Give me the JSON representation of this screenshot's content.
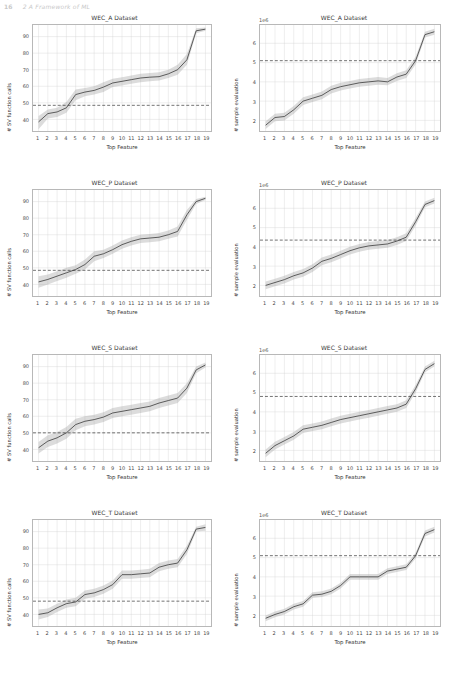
{
  "header": {
    "page_number": "16",
    "running_title": "2 A Framework of ML"
  },
  "figure": {
    "xlabel": "Top Feature",
    "ylabel_left": "# SV function calls",
    "ylabel_right": "# sample evaluation",
    "offset_label_right": "1e6",
    "xticks": [
      "1",
      "2",
      "3",
      "4",
      "5",
      "6",
      "7",
      "8",
      "9",
      "10",
      "11",
      "12",
      "13",
      "14",
      "15",
      "16",
      "17",
      "18",
      "19"
    ],
    "yticks_left": [
      "40",
      "50",
      "60",
      "70",
      "80",
      "90"
    ],
    "yticks_right": [
      "2",
      "3",
      "4",
      "5",
      "6"
    ]
  },
  "chart_data": [
    {
      "type": "line",
      "title": "WEC_A Dataset",
      "xlabel": "Top Feature",
      "ylabel": "# SV function calls",
      "x": [
        1,
        2,
        3,
        4,
        5,
        6,
        7,
        8,
        9,
        10,
        11,
        12,
        13,
        14,
        15,
        16,
        17,
        18,
        19
      ],
      "values": [
        38.5,
        43.5,
        44.5,
        47.0,
        55.0,
        56.5,
        57.5,
        59.5,
        62.0,
        63.0,
        64.0,
        65.0,
        65.5,
        65.8,
        67.5,
        70.0,
        76.0,
        93.5,
        94.5
      ],
      "band_lower": [
        34.0,
        40.5,
        41.5,
        44.0,
        51.5,
        54.0,
        55.0,
        56.5,
        59.5,
        60.5,
        61.5,
        62.5,
        63.0,
        63.5,
        65.0,
        67.0,
        73.0,
        92.0,
        93.5
      ],
      "band_upper": [
        42.0,
        46.0,
        47.0,
        50.5,
        58.0,
        59.0,
        60.0,
        62.5,
        64.5,
        65.5,
        66.5,
        67.5,
        68.0,
        68.5,
        70.0,
        73.0,
        79.5,
        95.0,
        95.5
      ],
      "hline": 48.5,
      "ylim": [
        33,
        97
      ],
      "xlim": [
        0.4,
        19.6
      ],
      "grid": true,
      "legend": "none"
    },
    {
      "type": "line",
      "title": "WEC_A Dataset",
      "xlabel": "Top Feature",
      "ylabel": "# sample evaluation",
      "offset": "1e6",
      "x": [
        1,
        2,
        3,
        4,
        5,
        6,
        7,
        8,
        9,
        10,
        11,
        12,
        13,
        14,
        15,
        16,
        17,
        18,
        19
      ],
      "values": [
        1.75,
        2.15,
        2.2,
        2.55,
        3.0,
        3.15,
        3.3,
        3.6,
        3.75,
        3.85,
        3.95,
        4.0,
        4.05,
        4.0,
        4.25,
        4.4,
        5.1,
        6.45,
        6.6
      ],
      "band_lower": [
        1.55,
        1.95,
        2.0,
        2.35,
        2.8,
        2.95,
        3.1,
        3.4,
        3.55,
        3.65,
        3.75,
        3.8,
        3.85,
        3.82,
        4.05,
        4.2,
        4.9,
        6.3,
        6.45
      ],
      "band_upper": [
        1.95,
        2.35,
        2.4,
        2.75,
        3.2,
        3.35,
        3.5,
        3.8,
        3.95,
        4.05,
        4.15,
        4.2,
        4.25,
        4.2,
        4.45,
        4.6,
        5.3,
        6.6,
        6.75
      ],
      "hline": 5.1,
      "ylim": [
        1.45,
        6.95
      ],
      "xlim": [
        0.4,
        19.6
      ],
      "grid": true,
      "legend": "none"
    },
    {
      "type": "line",
      "title": "WEC_P Dataset",
      "xlabel": "Top Feature",
      "ylabel": "# SV function calls",
      "x": [
        1,
        2,
        3,
        4,
        5,
        6,
        7,
        8,
        9,
        10,
        11,
        12,
        13,
        14,
        15,
        16,
        17,
        18,
        19
      ],
      "values": [
        41.5,
        43.0,
        45.0,
        47.0,
        49.0,
        52.0,
        57.0,
        58.5,
        61.0,
        64.0,
        66.0,
        67.5,
        68.0,
        68.5,
        70.0,
        72.0,
        82.0,
        90.0,
        92.0
      ],
      "band_lower": [
        38.0,
        40.0,
        42.0,
        44.0,
        46.5,
        49.0,
        54.0,
        56.0,
        58.5,
        61.5,
        63.5,
        65.0,
        65.5,
        66.0,
        67.5,
        69.0,
        79.0,
        88.5,
        91.0
      ],
      "band_upper": [
        45.0,
        46.0,
        48.0,
        50.0,
        51.5,
        55.0,
        60.0,
        61.0,
        63.5,
        66.5,
        68.5,
        70.0,
        70.5,
        71.0,
        72.5,
        75.0,
        85.0,
        91.5,
        93.0
      ],
      "hline": 48.5,
      "ylim": [
        33,
        97
      ],
      "xlim": [
        0.4,
        19.6
      ],
      "grid": true,
      "legend": "none"
    },
    {
      "type": "line",
      "title": "WEC_P Dataset",
      "xlabel": "Top Feature",
      "ylabel": "# sample evaluation",
      "offset": "1e6",
      "x": [
        1,
        2,
        3,
        4,
        5,
        6,
        7,
        8,
        9,
        10,
        11,
        12,
        13,
        14,
        15,
        16,
        17,
        18,
        19
      ],
      "values": [
        2.0,
        2.15,
        2.3,
        2.5,
        2.65,
        2.9,
        3.25,
        3.4,
        3.6,
        3.8,
        3.95,
        4.05,
        4.1,
        4.15,
        4.3,
        4.5,
        5.3,
        6.2,
        6.4
      ],
      "band_lower": [
        1.8,
        1.95,
        2.1,
        2.3,
        2.45,
        2.7,
        3.05,
        3.2,
        3.4,
        3.6,
        3.75,
        3.85,
        3.9,
        3.95,
        4.1,
        4.3,
        5.1,
        6.05,
        6.25
      ],
      "band_upper": [
        2.2,
        2.35,
        2.5,
        2.7,
        2.85,
        3.1,
        3.45,
        3.6,
        3.8,
        4.0,
        4.15,
        4.25,
        4.3,
        4.35,
        4.5,
        4.7,
        5.5,
        6.35,
        6.55
      ],
      "hline": 4.35,
      "ylim": [
        1.45,
        6.95
      ],
      "xlim": [
        0.4,
        19.6
      ],
      "grid": true,
      "legend": "none"
    },
    {
      "type": "line",
      "title": "WEC_S Dataset",
      "xlabel": "Top Feature",
      "ylabel": "# SV function calls",
      "x": [
        1,
        2,
        3,
        4,
        5,
        6,
        7,
        8,
        9,
        10,
        11,
        12,
        13,
        14,
        15,
        16,
        17,
        18,
        19
      ],
      "values": [
        41.0,
        45.0,
        47.0,
        50.0,
        55.0,
        57.0,
        58.0,
        59.5,
        62.0,
        63.0,
        64.0,
        65.0,
        66.0,
        68.0,
        69.5,
        71.0,
        77.0,
        88.0,
        91.0
      ],
      "band_lower": [
        37.5,
        41.5,
        43.5,
        46.5,
        51.5,
        54.0,
        55.0,
        56.5,
        59.0,
        60.0,
        61.0,
        62.0,
        63.0,
        65.0,
        66.5,
        68.0,
        74.0,
        86.0,
        89.5
      ],
      "band_upper": [
        44.5,
        48.5,
        50.5,
        53.5,
        58.5,
        60.0,
        61.0,
        62.5,
        65.0,
        66.0,
        67.0,
        68.0,
        69.0,
        71.0,
        72.5,
        74.0,
        80.0,
        90.0,
        92.5
      ],
      "hline": 50.0,
      "ylim": [
        33,
        97
      ],
      "xlim": [
        0.4,
        19.6
      ],
      "grid": true,
      "legend": "none"
    },
    {
      "type": "line",
      "title": "WEC_S Dataset",
      "xlabel": "Top Feature",
      "ylabel": "# sample evaluation",
      "offset": "1e6",
      "x": [
        1,
        2,
        3,
        4,
        5,
        6,
        7,
        8,
        9,
        10,
        11,
        12,
        13,
        14,
        15,
        16,
        17,
        18,
        19
      ],
      "values": [
        1.85,
        2.25,
        2.5,
        2.75,
        3.1,
        3.2,
        3.3,
        3.45,
        3.6,
        3.7,
        3.8,
        3.9,
        4.0,
        4.1,
        4.2,
        4.4,
        5.2,
        6.2,
        6.5
      ],
      "band_lower": [
        1.65,
        2.05,
        2.3,
        2.55,
        2.9,
        3.0,
        3.1,
        3.25,
        3.4,
        3.5,
        3.6,
        3.7,
        3.8,
        3.9,
        4.0,
        4.2,
        5.0,
        6.05,
        6.35
      ],
      "band_upper": [
        2.05,
        2.45,
        2.7,
        2.95,
        3.3,
        3.4,
        3.5,
        3.65,
        3.8,
        3.9,
        4.0,
        4.1,
        4.2,
        4.3,
        4.4,
        4.6,
        5.4,
        6.35,
        6.65
      ],
      "hline": 4.8,
      "ylim": [
        1.45,
        6.95
      ],
      "xlim": [
        0.4,
        19.6
      ],
      "grid": true,
      "legend": "none"
    },
    {
      "type": "line",
      "title": "WEC_T Dataset",
      "xlabel": "Top Feature",
      "ylabel": "# SV function calls",
      "x": [
        1,
        2,
        3,
        4,
        5,
        6,
        7,
        8,
        9,
        10,
        11,
        12,
        13,
        14,
        15,
        16,
        17,
        18,
        19
      ],
      "values": [
        40.0,
        41.0,
        44.0,
        46.5,
        47.5,
        52.0,
        53.0,
        55.0,
        58.0,
        64.0,
        64.0,
        64.5,
        65.0,
        68.5,
        70.0,
        71.0,
        79.0,
        91.5,
        92.5
      ],
      "band_lower": [
        37.0,
        38.5,
        41.5,
        44.0,
        45.0,
        49.5,
        50.5,
        52.5,
        55.5,
        61.5,
        61.5,
        62.0,
        62.5,
        66.0,
        67.5,
        68.5,
        76.5,
        90.0,
        90.5
      ],
      "band_upper": [
        43.0,
        43.5,
        46.5,
        49.0,
        50.0,
        54.5,
        55.5,
        57.5,
        60.5,
        66.5,
        66.5,
        67.0,
        67.5,
        71.0,
        72.5,
        73.5,
        81.5,
        93.0,
        94.5
      ],
      "hline": 48.0,
      "ylim": [
        33,
        97
      ],
      "xlim": [
        0.4,
        19.6
      ],
      "grid": true,
      "legend": "none"
    },
    {
      "type": "line",
      "title": "WEC_T Dataset",
      "xlabel": "Top Feature",
      "ylabel": "# sample evaluation",
      "offset": "1e6",
      "x": [
        1,
        2,
        3,
        4,
        5,
        6,
        7,
        8,
        9,
        10,
        11,
        12,
        13,
        14,
        15,
        16,
        17,
        18,
        19
      ],
      "values": [
        1.85,
        2.05,
        2.2,
        2.45,
        2.6,
        3.05,
        3.1,
        3.25,
        3.55,
        4.0,
        4.0,
        4.0,
        4.0,
        4.3,
        4.4,
        4.5,
        5.1,
        6.25,
        6.45
      ],
      "band_lower": [
        1.7,
        1.9,
        2.05,
        2.3,
        2.45,
        2.9,
        2.95,
        3.1,
        3.4,
        3.85,
        3.85,
        3.85,
        3.85,
        4.15,
        4.25,
        4.35,
        4.95,
        6.1,
        6.3
      ],
      "band_upper": [
        2.0,
        2.2,
        2.35,
        2.6,
        2.75,
        3.2,
        3.25,
        3.4,
        3.7,
        4.15,
        4.15,
        4.15,
        4.15,
        4.45,
        4.55,
        4.65,
        5.25,
        6.4,
        6.6
      ],
      "hline": 5.1,
      "ylim": [
        1.45,
        6.95
      ],
      "xlim": [
        0.4,
        19.6
      ],
      "grid": true,
      "legend": "none"
    }
  ]
}
